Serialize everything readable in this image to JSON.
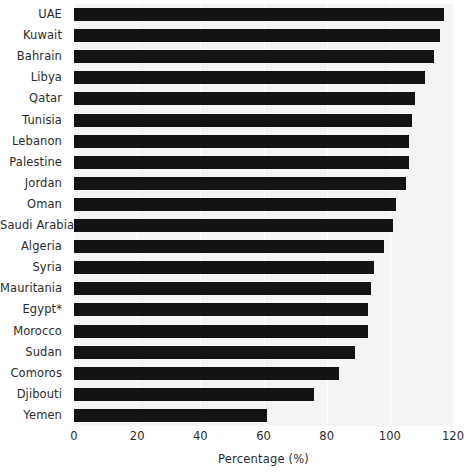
{
  "chart_data": {
    "type": "bar",
    "orientation": "horizontal",
    "title": "",
    "xlabel": "Percentage (%)",
    "ylabel": "",
    "xlim": [
      0,
      120
    ],
    "xticks": [
      0,
      20,
      40,
      60,
      80,
      100,
      120
    ],
    "grid": true,
    "legend": null,
    "bar_color": "#131313",
    "plot_background": "#f4f4f4",
    "gridline_color": "#ffffff",
    "categories": [
      "UAE",
      "Kuwait",
      "Bahrain",
      "Libya",
      "Qatar",
      "Tunisia",
      "Lebanon",
      "Palestine",
      "Jordan",
      "Oman",
      "Saudi Arabia",
      "Algeria",
      "Syria",
      "Mauritania",
      "Egypt*",
      "Morocco",
      "Sudan",
      "Comoros",
      "Djibouti",
      "Yemen"
    ],
    "values": [
      117,
      116,
      114,
      111,
      108,
      107,
      106,
      106,
      105,
      102,
      101,
      98,
      95,
      94,
      93,
      93,
      89,
      84,
      76,
      61
    ]
  }
}
